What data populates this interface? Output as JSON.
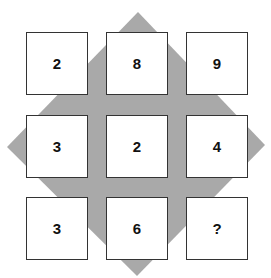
{
  "puzzle": {
    "background_shape": "diamond",
    "diamond_color": "#a9a9a9",
    "grid": [
      [
        "2",
        "8",
        "9"
      ],
      [
        "3",
        "2",
        "4"
      ],
      [
        "3",
        "6",
        "?"
      ]
    ]
  }
}
